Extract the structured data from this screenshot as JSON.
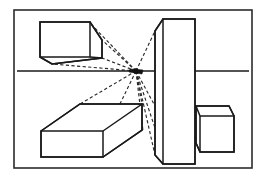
{
  "figure": {
    "background_color": "#ffffff",
    "line_color": "#1a1a1a",
    "construction_line_color": "#2a2a2a",
    "frame_color": "#2b2b2b",
    "canvas": {
      "width": 264,
      "height": 178
    }
  },
  "frame": {
    "name": "picture-border",
    "x": 14,
    "y": 10,
    "width": 238,
    "height": 158
  },
  "horizon": {
    "label": "horizon-line",
    "y": 71,
    "segments": [
      {
        "x1": 17,
        "x2": 163
      },
      {
        "x1": 185,
        "x2": 249
      }
    ]
  },
  "vanishing_point": {
    "label": "vanishing-point",
    "x": 136,
    "y": 71,
    "radius": 2.6
  },
  "objects": [
    {
      "id": "box-upper-left",
      "label": "Upper left box (above horizon)",
      "front_face": "40,22 90,22 90,57 40,57",
      "top_face": "40,22 90,22 102,40 52,40",
      "silhouette": "40,22 90,22 102,40 102,58 52,64 40,57",
      "edges": [
        "M40,22 L90,22 L90,57 L40,57 Z",
        "M90,22 L102,40 L102,58 L90,57",
        "M40,57 L52,64 L102,58",
        "M52,64 L52,40 L40,22",
        "M52,40 L102,40"
      ]
    },
    {
      "id": "box-lower-left",
      "label": "Lower left box (below horizon)",
      "edges": [
        "M41,131 L103,131 L103,157 L41,157 Z",
        "M41,131 L80,104 L142,104 L103,131",
        "M103,131 L103,157",
        "M142,104 L142,130 L103,157"
      ]
    },
    {
      "id": "slab-center",
      "label": "Central vertical slab",
      "edges": [
        "M163,19 L195,19 L195,164 L163,164 Z",
        "M163,19 L155,31 L155,155 L163,164",
        "M155,31 L163,19"
      ]
    },
    {
      "id": "box-lower-right",
      "label": "Lower right box (right of slab)",
      "edges": [
        "M200,116 L234,116 L234,152 L200,152 Z",
        "M200,116 L196,106 L229,106 L234,116",
        "M196,106 L196,143 L200,152"
      ]
    }
  ],
  "construction_lines": {
    "label": "dashed-convergence-lines",
    "count": 11,
    "targets": [
      {
        "to": "box-upper-left-top-far",
        "x": 102,
        "y": 40
      },
      {
        "to": "box-upper-left-bottom-far",
        "x": 102,
        "y": 58
      },
      {
        "to": "box-upper-left-lower-corner",
        "x": 52,
        "y": 64
      },
      {
        "to": "box-upper-left-top-rear",
        "x": 90,
        "y": 22
      },
      {
        "to": "box-lower-left-top-rear",
        "x": 80,
        "y": 104
      },
      {
        "to": "box-lower-left-top-near",
        "x": 142,
        "y": 104
      },
      {
        "to": "box-lower-left-far-corner",
        "x": 142,
        "y": 130
      },
      {
        "to": "slab-top-left-bevel",
        "x": 155,
        "y": 31
      },
      {
        "to": "slab-bottom-left-bevel",
        "x": 155,
        "y": 155
      },
      {
        "to": "box-lower-right-top-rear",
        "x": 196,
        "y": 106
      },
      {
        "to": "box-lower-right-bottom-rear",
        "x": 196,
        "y": 143
      }
    ]
  }
}
